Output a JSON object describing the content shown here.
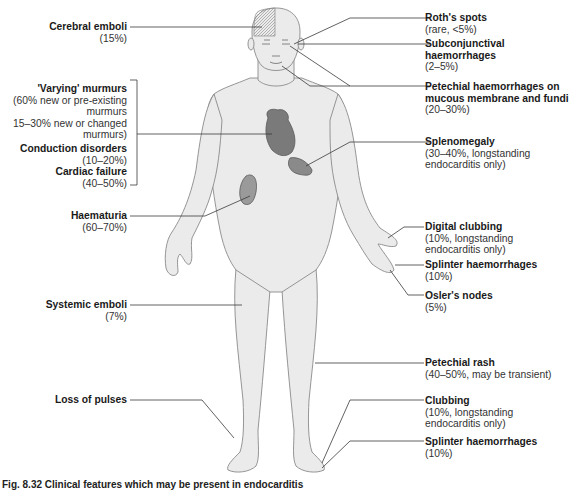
{
  "figure": {
    "caption": "Fig. 8.32  Clinical features which may be present in endocarditis",
    "left_labels": [
      {
        "id": "cerebral",
        "title": "Cerebral emboli",
        "detail": [
          "(15%)"
        ]
      },
      {
        "id": "murmurs",
        "title": "'Varying' murmurs",
        "detail": [
          "(60% new or pre-existing",
          "murmurs",
          "15–30% new or changed",
          "murmurs)"
        ]
      },
      {
        "id": "conduction",
        "title": "Conduction disorders",
        "detail": [
          "(10–20%)"
        ]
      },
      {
        "id": "cardiac",
        "title": "Cardiac failure",
        "detail": [
          "(40–50%)"
        ]
      },
      {
        "id": "haematuria",
        "title": "Haematuria",
        "detail": [
          "(60–70%)"
        ]
      },
      {
        "id": "systemic",
        "title": "Systemic emboli",
        "detail": [
          "(7%)"
        ]
      },
      {
        "id": "pulses",
        "title": "Loss of pulses",
        "detail": []
      }
    ],
    "right_labels": [
      {
        "id": "roth",
        "title": "Roth's spots",
        "detail": [
          "(rare, <5%)"
        ]
      },
      {
        "id": "subconj",
        "title": "Subconjunctival haemorrhages",
        "title_lines": [
          "Subconjunctival",
          "haemorrhages"
        ],
        "detail": [
          "(2–5%)"
        ]
      },
      {
        "id": "petechial_mucous",
        "title_lines": [
          "Petechial haemorrhages on",
          "mucous membrane and fundi"
        ],
        "detail": [
          "(20–30%)"
        ]
      },
      {
        "id": "spleno",
        "title": "Splenomegaly",
        "detail": [
          "(30–40%, longstanding",
          "endocarditis only)"
        ]
      },
      {
        "id": "digital",
        "title": "Digital clubbing",
        "detail": [
          "(10%, longstanding",
          "endocarditis only)"
        ]
      },
      {
        "id": "splinter_hand",
        "title": "Splinter haemorrhages",
        "detail": [
          "(10%)"
        ]
      },
      {
        "id": "osler",
        "title": "Osler's nodes",
        "detail": [
          "(5%)"
        ]
      },
      {
        "id": "rash",
        "title": "Petechial rash",
        "detail": [
          "(40–50%, may be transient)"
        ]
      },
      {
        "id": "clubbing_foot",
        "title": "Clubbing",
        "detail": [
          "(10%, longstanding",
          "endocarditis only)"
        ]
      },
      {
        "id": "splinter_foot",
        "title": "Splinter haemorrhages",
        "detail": [
          "(10%)"
        ]
      }
    ],
    "colors": {
      "body_fill": "#ebebeb",
      "body_outline": "#8a8a8a",
      "organ_fill": "#7a7a7a",
      "organ_light": "#9a9a9a",
      "leader_line": "#3a3a3a"
    }
  }
}
